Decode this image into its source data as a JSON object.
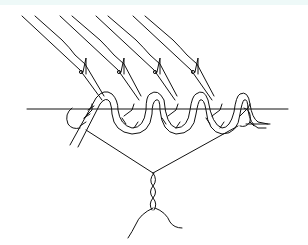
{
  "illustration": {
    "subject": "line drawing of hooks on lines attached to a twisted cord along a horizontal line, converging to a twisted stem",
    "hook_count": 4,
    "colors": {
      "ink": "#111111",
      "background": "#ffffff",
      "top_band": "#eef9f8"
    }
  }
}
